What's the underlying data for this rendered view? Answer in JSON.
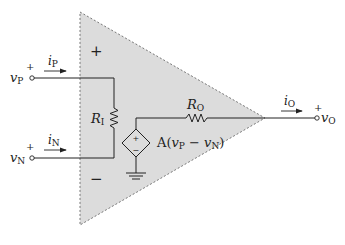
{
  "diagram": {
    "colors": {
      "triangle_fill": "#dcdcdc",
      "triangle_stroke": "#666666",
      "wire": "#222222",
      "background": "#ffffff"
    },
    "inputs": {
      "noninverting": {
        "voltage_label": "v",
        "voltage_subscript": "P",
        "polarity": "+",
        "current_label": "i",
        "current_subscript": "P"
      },
      "inverting": {
        "voltage_label": "v",
        "voltage_subscript": "N",
        "polarity": "+",
        "current_label": "i",
        "current_subscript": "N"
      }
    },
    "terminal_signs": {
      "plus": "+",
      "minus": "−"
    },
    "input_resistor": {
      "label": "R",
      "subscript": "I"
    },
    "output_resistor": {
      "label": "R",
      "subscript": "O"
    },
    "dependent_source": {
      "plus": "+",
      "minus": "−",
      "expr_prefix": "A(",
      "v1": "v",
      "v1_sub": "P",
      "op": " − ",
      "v2": "v",
      "v2_sub": "N",
      "expr_suffix": ")"
    },
    "output": {
      "voltage_label": "v",
      "voltage_subscript": "O",
      "polarity": "+",
      "current_label": "i",
      "current_subscript": "O"
    },
    "icons": [
      "ground-icon",
      "resistor-icon",
      "dependent-voltage-source-icon",
      "terminal-circle-icon",
      "current-arrow-icon"
    ]
  }
}
